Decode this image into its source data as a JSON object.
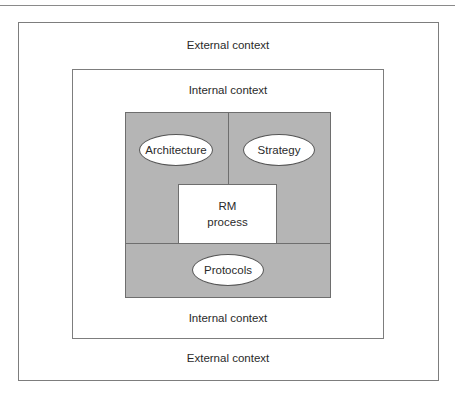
{
  "diagram": {
    "layers": {
      "external_top": "External context",
      "internal_top": "Internal context",
      "internal_bottom": "Internal context",
      "external_bottom": "External context"
    },
    "core": {
      "rm_process_line1": "RM",
      "rm_process_line2": "process",
      "nodes": [
        {
          "label": "Architecture"
        },
        {
          "label": "Strategy"
        },
        {
          "label": "Protocols"
        }
      ]
    },
    "colors": {
      "core_fill": "#b5b5b5",
      "border": "#7d7d7d",
      "node_fill": "#ffffff"
    }
  }
}
